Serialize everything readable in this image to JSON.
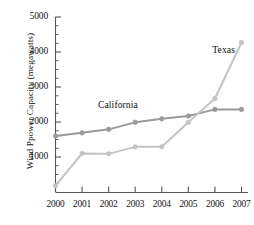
{
  "chart_data": {
    "type": "line",
    "title": "",
    "xlabel": "",
    "ylabel": "Wind Ppower Capacity (megawatts)",
    "categories": [
      "2000",
      "2001",
      "2002",
      "2003",
      "2004",
      "2005",
      "2006",
      "2007"
    ],
    "x": [
      2000,
      2001,
      2002,
      2003,
      2004,
      2005,
      2006,
      2007
    ],
    "ylim": [
      0,
      5000
    ],
    "xlim": [
      2000,
      2007
    ],
    "y_ticks": [
      1000,
      2000,
      3000,
      4000,
      5000
    ],
    "y_minor_tick_step": 250,
    "grid": false,
    "legend_position": "inline-annotation",
    "series": [
      {
        "name": "California",
        "color": "#9a9a9a",
        "marker": "circle",
        "values": [
          1600,
          1690,
          1790,
          1990,
          2090,
          2170,
          2360,
          2360
        ],
        "annotation": {
          "text": "California",
          "x": 2001.6,
          "y": 2480
        }
      },
      {
        "name": "Texas",
        "color": "#c4c4c4",
        "marker": "circle",
        "values": [
          180,
          1100,
          1090,
          1290,
          1290,
          1990,
          2670,
          4270
        ],
        "annotation": {
          "text": "Texas",
          "x": 2005.9,
          "y": 4040
        }
      }
    ]
  },
  "axis": {
    "y_tick_labels": [
      "5000",
      "4000",
      "3000",
      "2000",
      "1000"
    ],
    "x_tick_labels": [
      "2000",
      "2001",
      "2002",
      "2003",
      "2004",
      "2005",
      "2006",
      "2007"
    ],
    "y_axis_title": "Wind Ppower Capacity (megawatts)"
  },
  "annotations": {
    "california_label": "California",
    "texas_label": "Texas"
  }
}
